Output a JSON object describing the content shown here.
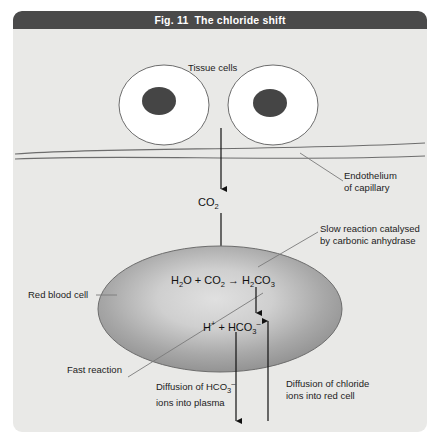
{
  "figure": {
    "title_number": "Fig. 11",
    "title_text": "The chloride shift"
  },
  "labels": {
    "tissue_cells": "Tissue cells",
    "endothelium_line1": "Endothelium",
    "endothelium_line2": "of capillary",
    "slow_reaction_line1": "Slow reaction catalysed",
    "slow_reaction_line2": "by carbonic anhydrase",
    "red_blood_cell": "Red blood cell",
    "fast_reaction": "Fast reaction",
    "diffusion_hco3_line1": "Diffusion of HCO",
    "diffusion_hco3_sub": "3",
    "diffusion_hco3_sup": "–",
    "diffusion_hco3_line2": "ions into plasma",
    "diffusion_cl_line1": "Diffusion of chloride",
    "diffusion_cl_line2": "ions into red cell"
  },
  "equations": {
    "co2": {
      "main": "CO",
      "sub": "2"
    },
    "carbonic_anhydrase": {
      "water": "H",
      "water_sub": "2",
      "water_tail": "O",
      "plus": "+",
      "co2": "CO",
      "co2_sub": "2",
      "arrow": "→",
      "product": "H",
      "product_sub1": "2",
      "product_mid": "CO",
      "product_sub2": "3"
    },
    "dissociation": {
      "hydrogen": "H",
      "hydrogen_sup": "+",
      "plus": "+",
      "bicarb": "HCO",
      "bicarb_sub": "3",
      "bicarb_sup": "–"
    },
    "chloride": {
      "main": "Cl",
      "sup": "–"
    }
  },
  "colors": {
    "title_bar": "#4a4a4a",
    "panel_background": "#e9e9e7",
    "title_text": "#ffffff",
    "cell_fill": "#ffffff",
    "nucleus_fill": "#3f3f3f",
    "red_blood_cell_edge": "#7f7f7f",
    "red_blood_cell_center": "#d2d2d2",
    "stroke": "#5a5a5a",
    "arrow": "#111111"
  }
}
